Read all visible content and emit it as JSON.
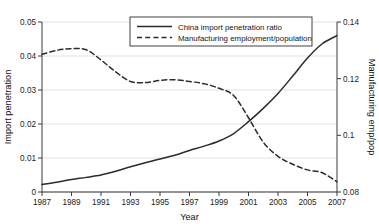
{
  "chart_data": {
    "type": "line",
    "title": "",
    "xlabel": "Year",
    "ylabel": "Import penetration",
    "ylabel_right": "Manufacturing emp/pop",
    "xlim": [
      1987,
      2007
    ],
    "ylim": [
      0,
      0.05
    ],
    "ylim_right": [
      0.08,
      0.14
    ],
    "grid": true,
    "grid_axis": "y",
    "legend_position": "top-center",
    "xticks": [
      1987,
      1989,
      1991,
      1993,
      1995,
      1997,
      1999,
      2001,
      2003,
      2005,
      2007
    ],
    "xticklabels": [
      "1987",
      "1989",
      "1991",
      "1993",
      "1995",
      "1997",
      "1999",
      "2001",
      "2003",
      "2005",
      "2007"
    ],
    "yticks": [
      0,
      0.01,
      0.02,
      0.03,
      0.04,
      0.05
    ],
    "yticklabels": [
      "0",
      "0.01",
      "0.02",
      "0.03",
      "0.04",
      "0.05"
    ],
    "yticks_right": [
      0.08,
      0.1,
      0.12,
      0.14
    ],
    "yticklabels_right": [
      "0.08",
      "0.1",
      "0.12",
      "0.14"
    ],
    "x": [
      1987,
      1988,
      1989,
      1990,
      1991,
      1992,
      1993,
      1994,
      1995,
      1996,
      1997,
      1998,
      1999,
      2000,
      2001,
      2002,
      2003,
      2004,
      2005,
      2006,
      2007
    ],
    "series": [
      {
        "name": "China import penetration ratio",
        "axis": "left",
        "style": "solid",
        "color": "#2b2b2b",
        "values": [
          0.0022,
          0.0029,
          0.0037,
          0.0043,
          0.005,
          0.0061,
          0.0074,
          0.0086,
          0.0097,
          0.0108,
          0.0122,
          0.0135,
          0.015,
          0.0172,
          0.0207,
          0.0246,
          0.029,
          0.0341,
          0.0394,
          0.0436,
          0.046
        ]
      },
      {
        "name": "Manufacturing employment/population",
        "axis": "right",
        "style": "dashed",
        "color": "#2b2b2b",
        "values": [
          0.1286,
          0.13,
          0.1306,
          0.1302,
          0.1266,
          0.1224,
          0.119,
          0.1186,
          0.1194,
          0.1196,
          0.119,
          0.1182,
          0.1166,
          0.114,
          0.1062,
          0.0976,
          0.0926,
          0.0898,
          0.0878,
          0.0868,
          0.0836
        ]
      }
    ],
    "legend": [
      {
        "label": "China import penetration ratio",
        "style": "solid"
      },
      {
        "label": "Manufacturing employment/population",
        "style": "dashed"
      }
    ]
  }
}
